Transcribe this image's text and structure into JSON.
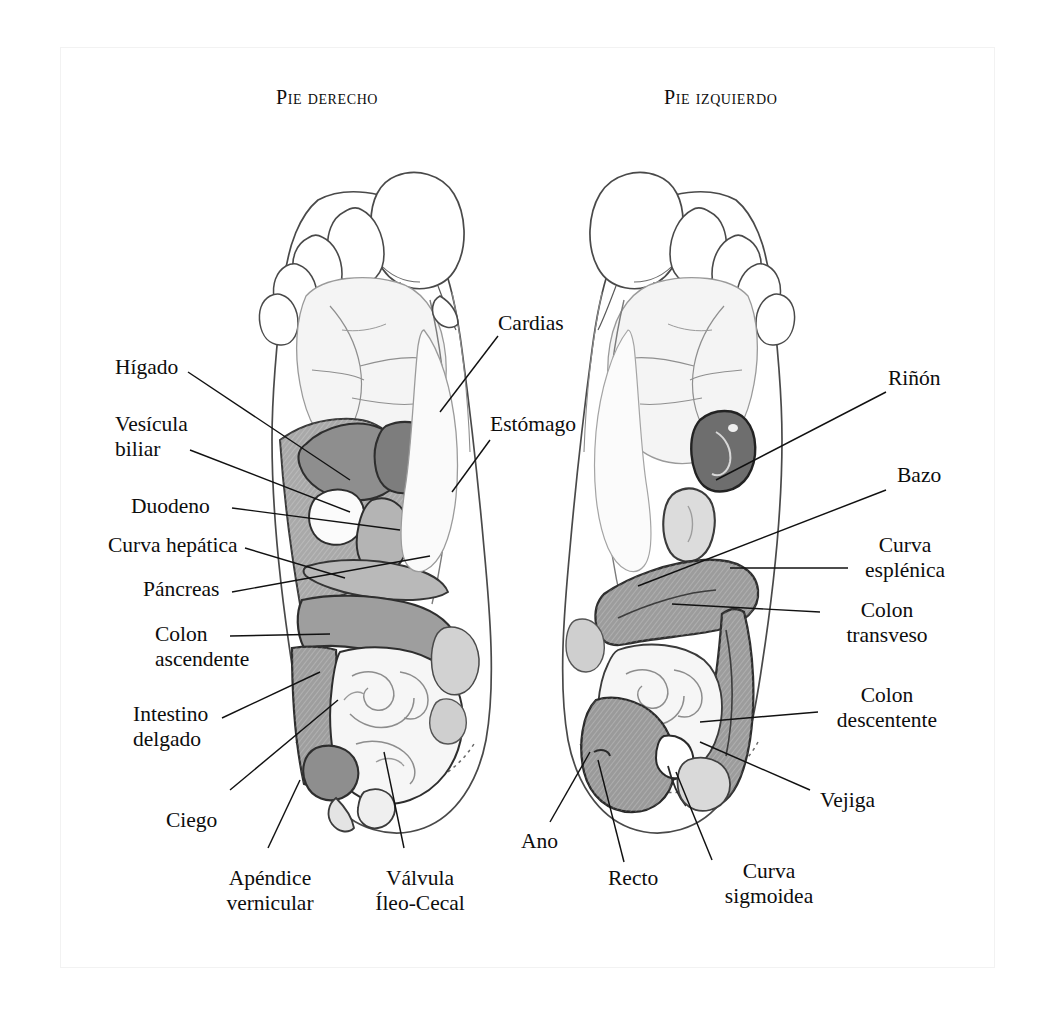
{
  "figure": {
    "kind": "reflexology-foot-chart",
    "language": "es",
    "headings": [
      {
        "name": "right-foot-heading",
        "text": "Pie derecho"
      },
      {
        "name": "left-foot-heading",
        "text": "Pie izquierdo"
      }
    ]
  },
  "palette": {
    "paper": "#ffffff",
    "ink": "#0d0d0d",
    "outline": "#3c3c3c",
    "leader": "#111111",
    "shade_light": "#efefef",
    "shade_pale": "#e2e2e2",
    "shade_mid": "#c3c3c3",
    "shade_medium": "#a9a9a9",
    "shade_dark": "#8a8a8a",
    "shade_darker": "#6e6e6e",
    "page_border": "#f2f2f2"
  },
  "labels": {
    "left_column": [
      {
        "id": "higado",
        "text": "Hígado",
        "lines": [
          "Hígado"
        ]
      },
      {
        "id": "vesicula-biliar",
        "text": "Vesícula biliar",
        "lines": [
          "Vesícula",
          "biliar"
        ]
      },
      {
        "id": "duodeno",
        "text": "Duodeno",
        "lines": [
          "Duodeno"
        ]
      },
      {
        "id": "curva-hepatica",
        "text": "Curva hepática",
        "lines": [
          "Curva hepática"
        ]
      },
      {
        "id": "pancreas",
        "text": "Páncreas",
        "lines": [
          "Páncreas"
        ]
      },
      {
        "id": "colon-ascendente",
        "text": "Colon ascendente",
        "lines": [
          "Colon",
          "ascendente"
        ]
      },
      {
        "id": "intestino-delgado",
        "text": "Intestino delgado",
        "lines": [
          "Intestino",
          "delgado"
        ]
      },
      {
        "id": "ciego",
        "text": "Ciego",
        "lines": [
          "Ciego"
        ]
      }
    ],
    "bottom_center": [
      {
        "id": "apendice-vernicular",
        "text": "Apéndice vernicular",
        "lines": [
          "Apéndice",
          "vernicular"
        ]
      },
      {
        "id": "valvula-ileo-cecal",
        "text": "Válvula Íleo-Cecal",
        "lines": [
          "Válvula",
          "Íleo-Cecal"
        ]
      }
    ],
    "center_top": [
      {
        "id": "cardias",
        "text": "Cardias",
        "lines": [
          "Cardias"
        ]
      },
      {
        "id": "estomago",
        "text": "Estómago",
        "lines": [
          "Estómago"
        ]
      }
    ],
    "right_column": [
      {
        "id": "rinon",
        "text": "Riñón",
        "lines": [
          "Riñón"
        ]
      },
      {
        "id": "bazo",
        "text": "Bazo",
        "lines": [
          "Bazo"
        ]
      },
      {
        "id": "curva-esplenica",
        "text": "Curva esplénica",
        "lines": [
          "Curva",
          "esplénica"
        ]
      },
      {
        "id": "colon-transveso",
        "text": "Colon transveso",
        "lines": [
          "Colon",
          "transveso"
        ]
      },
      {
        "id": "colon-descentente",
        "text": "Colon descentente",
        "lines": [
          "Colon",
          "descentente"
        ]
      },
      {
        "id": "vejiga",
        "text": "Vejiga",
        "lines": [
          "Vejiga"
        ]
      }
    ],
    "bottom_right": [
      {
        "id": "ano",
        "text": "Ano",
        "lines": [
          "Ano"
        ]
      },
      {
        "id": "recto",
        "text": "Recto",
        "lines": [
          "Recto"
        ]
      },
      {
        "id": "curva-sigmoidea",
        "text": "Curva sigmoidea",
        "lines": [
          "Curva",
          "sigmoidea"
        ]
      }
    ]
  }
}
